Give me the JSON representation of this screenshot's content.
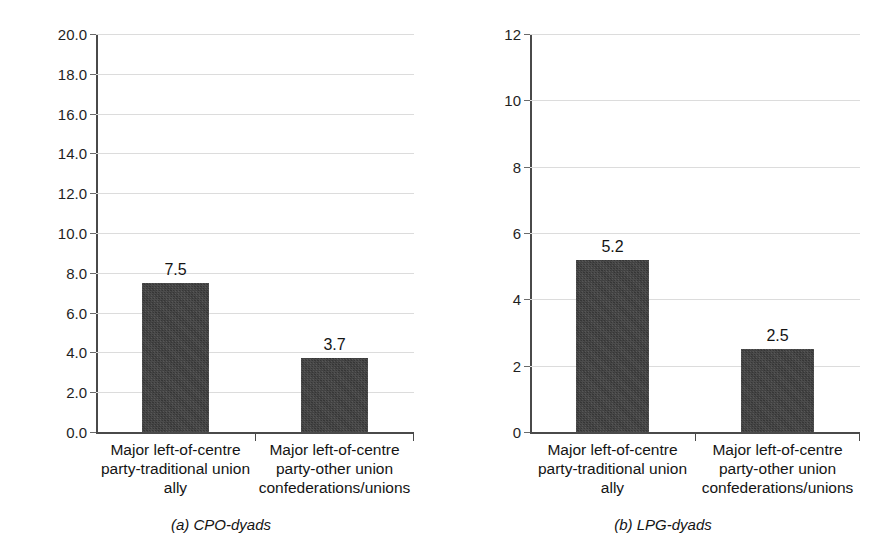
{
  "figure": {
    "background": "#ffffff",
    "bar_color": "#3c3c3c",
    "gridline_color": "#dcdcdc",
    "axis_color": "#4a4a4a"
  },
  "chart_data": [
    {
      "type": "bar",
      "panel_id": "a",
      "title": "",
      "caption": "(a) CPO-dyads",
      "categories": [
        "Major left-of-centre party-traditional union ally",
        "Major left-of-centre party-other union confederations/unions"
      ],
      "category_lines": [
        [
          "Major left-of-centre",
          "party-traditional union",
          "ally"
        ],
        [
          "Major left-of-centre",
          "party-other union",
          "confederations/unions"
        ]
      ],
      "values": [
        7.5,
        3.7
      ],
      "value_labels": [
        "7.5",
        "3.7"
      ],
      "xlabel": "",
      "ylabel": "",
      "ylim": [
        0,
        20
      ],
      "ytick_step": 2,
      "yticks": [
        0,
        2,
        4,
        6,
        8,
        10,
        12,
        14,
        16,
        18,
        20
      ],
      "ytick_labels": [
        "0.0",
        "2.0",
        "4.0",
        "6.0",
        "8.0",
        "10.0",
        "12.0",
        "14.0",
        "16.0",
        "18.0",
        "20.0"
      ],
      "grid": true,
      "legend": "none"
    },
    {
      "type": "bar",
      "panel_id": "b",
      "title": "",
      "caption": "(b) LPG-dyads",
      "categories": [
        "Major left-of-centre party-traditional union ally",
        "Major left-of-centre party-other union confederations/unions"
      ],
      "category_lines": [
        [
          "Major left-of-centre",
          "party-traditional union",
          "ally"
        ],
        [
          "Major left-of-centre",
          "party-other union",
          "confederations/unions"
        ]
      ],
      "values": [
        5.2,
        2.5
      ],
      "value_labels": [
        "5.2",
        "2.5"
      ],
      "xlabel": "",
      "ylabel": "",
      "ylim": [
        0,
        12
      ],
      "ytick_step": 2,
      "yticks": [
        0,
        2,
        4,
        6,
        8,
        10,
        12
      ],
      "ytick_labels": [
        "0",
        "2",
        "4",
        "6",
        "8",
        "10",
        "12"
      ],
      "grid": true,
      "legend": "none"
    }
  ]
}
